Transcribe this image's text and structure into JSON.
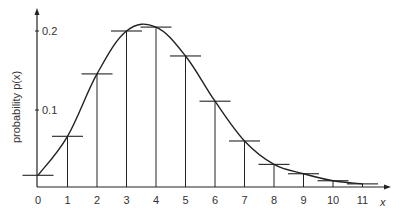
{
  "chart_data": {
    "type": "bar",
    "title": "",
    "xlabel": "x",
    "ylabel": "probability p(x)",
    "categories": [
      "0",
      "1",
      "2",
      "3",
      "4",
      "5",
      "6",
      "7",
      "8",
      "9",
      "10",
      "11"
    ],
    "values": [
      0.015,
      0.065,
      0.145,
      0.2,
      0.205,
      0.168,
      0.11,
      0.059,
      0.029,
      0.017,
      0.008,
      0.004
    ],
    "yticks": [
      "0.1",
      "0.2"
    ],
    "ylim": [
      0,
      0.22
    ],
    "xlim": [
      0,
      12
    ],
    "grid": false,
    "legend": null,
    "annotations": [],
    "style_notes": "Probability mass shown as vertical stems with short horizontal caps at each bar top, joined by a smooth curve through the stem tops."
  },
  "colors": {
    "ink": "#222222",
    "background": "#ffffff"
  }
}
